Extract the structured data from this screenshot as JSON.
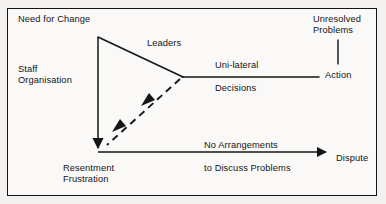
{
  "diagram": {
    "frame": {
      "stroke": "#151515",
      "background": "#faf9f7"
    },
    "labels": {
      "need_for_change": "Need for Change",
      "staff_organisation": "Staff\nOrganisation",
      "leaders": "Leaders",
      "unilateral": "Uni-lateral",
      "decisions": "Decisions",
      "unresolved_problems": "Unresolved\nProblems",
      "action": "Action",
      "resentment_frustration": "Resentment\nFrustration",
      "no_arrangements": "No Arrangements",
      "to_discuss_problems": "to Discuss Problems",
      "dispute": "Dispute"
    },
    "nodes": [
      {
        "id": "need-for-change",
        "label": "Need for Change",
        "x": 18,
        "y": 14
      },
      {
        "id": "staff-organisation",
        "label": "Staff Organisation",
        "x": 18,
        "y": 64
      },
      {
        "id": "leaders",
        "label": "Leaders",
        "x": 147,
        "y": 38
      },
      {
        "id": "unilateral-decisions",
        "label": "Uni-lateral Decisions",
        "x": 215,
        "y": 60
      },
      {
        "id": "unresolved-problems",
        "label": "Unresolved Problems",
        "x": 313,
        "y": 14
      },
      {
        "id": "action",
        "label": "Action",
        "x": 325,
        "y": 70
      },
      {
        "id": "resentment-frustration",
        "label": "Resentment Frustration",
        "x": 63,
        "y": 163
      },
      {
        "id": "no-arrangements",
        "label": "No Arrangements to Discuss Problems",
        "x": 204,
        "y": 140
      },
      {
        "id": "dispute",
        "label": "Dispute",
        "x": 336,
        "y": 153
      }
    ],
    "edges": [
      {
        "id": "apex-to-junction",
        "from": "apex",
        "to": "junction",
        "style": "solid",
        "arrow": "none",
        "label": "Leaders"
      },
      {
        "id": "junction-to-action",
        "from": "junction",
        "to": "action",
        "style": "solid",
        "arrow": "none",
        "label": "Uni-lateral Decisions"
      },
      {
        "id": "unresolved-to-action-line",
        "from": "unresolved-problems",
        "to": "action-line",
        "style": "solid",
        "arrow": "none",
        "label": ""
      },
      {
        "id": "junction-to-resentment",
        "from": "junction",
        "to": "resentment",
        "style": "dashed",
        "arrow": "double-inline",
        "label": ""
      },
      {
        "id": "apex-to-resentment",
        "from": "apex",
        "to": "resentment",
        "style": "solid",
        "arrow": "down",
        "label": ""
      },
      {
        "id": "resentment-to-dispute",
        "from": "resentment",
        "to": "dispute",
        "style": "solid",
        "arrow": "right",
        "label": "No Arrangements to Discuss Problems"
      }
    ],
    "geometry": {
      "apex": {
        "x": 98,
        "y": 37
      },
      "junction": {
        "x": 183,
        "y": 77
      },
      "bottom_left": {
        "x": 98,
        "y": 152
      },
      "action_line_end": {
        "x": 319,
        "y": 77
      },
      "dispute_arrow_end": {
        "x": 332,
        "y": 158
      },
      "unresolved_drop_x": 338,
      "unresolved_drop_y0": 40,
      "unresolved_drop_y1": 64
    },
    "colors": {
      "ink": "#141414",
      "line": "#151515",
      "paper": "#faf9f7",
      "page_background": "#f3f2f0"
    }
  }
}
